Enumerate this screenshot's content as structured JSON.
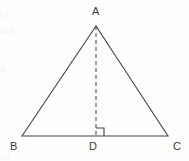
{
  "figure": {
    "background_color": "#fefefe",
    "stroke_color": "#404040",
    "label_color": "#3a3a3a",
    "ghost_color": "#f4f4f5",
    "labels": {
      "apex": "A",
      "bottom_left": "B",
      "foot": "D",
      "bottom_right": "C"
    },
    "points": {
      "A": {
        "x": 96,
        "y": 26
      },
      "B": {
        "x": 22,
        "y": 136
      },
      "C": {
        "x": 168,
        "y": 136
      },
      "D": {
        "x": 96,
        "y": 136
      }
    },
    "label_positions": {
      "A": {
        "x": 92,
        "y": 6
      },
      "B": {
        "x": 10,
        "y": 141
      },
      "D": {
        "x": 89,
        "y": 141
      },
      "C": {
        "x": 173,
        "y": 141
      }
    },
    "altitude": {
      "style": "dashed",
      "dash_pattern": "4 3",
      "from": "A",
      "to": "D"
    },
    "right_angle_mark": {
      "at": "D",
      "size": 8,
      "opens": "right"
    },
    "ghost_text": [
      {
        "text": "bleed-through line one",
        "x": 8,
        "y": 9
      },
      {
        "text": "faint reversed text",
        "x": 14,
        "y": 24
      },
      {
        "text": "show that triangle",
        "x": 6,
        "y": 62
      },
      {
        "text": "scanned page verso",
        "x": 10,
        "y": 150
      }
    ]
  }
}
